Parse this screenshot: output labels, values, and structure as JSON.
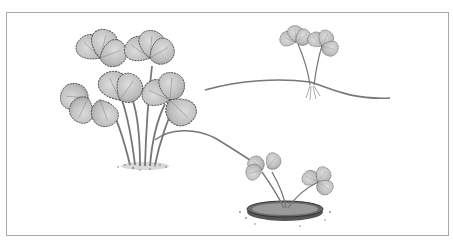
{
  "illustration": {
    "subject": "strawberry plant with runners",
    "style": "grayscale pencil illustration",
    "elements": [
      {
        "name": "mother-plant",
        "description": "large strawberry plant with trifoliate serrated leaves"
      },
      {
        "name": "runner-upper",
        "description": "runner stem extending right to a rooting daughter plant"
      },
      {
        "name": "daughter-plant-rooting",
        "description": "small plantlet with roots on runner"
      },
      {
        "name": "runner-lower",
        "description": "runner stem extending down-right to a potted plantlet"
      },
      {
        "name": "daughter-plant-potted",
        "description": "small plantlet rooted in a shallow pot of soil"
      }
    ]
  },
  "colors": {
    "border": "#a8a8a8",
    "leaf_fill": "#c4c4c4",
    "leaf_edge": "#555555",
    "stem": "#777777",
    "pot": "#4a4a4a",
    "soil": "#8a8a8a"
  }
}
